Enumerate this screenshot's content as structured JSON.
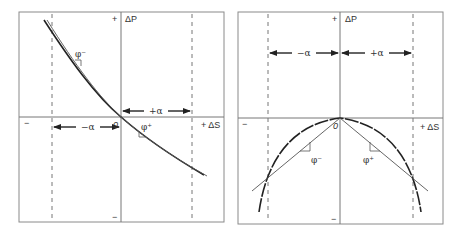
{
  "panels": [
    {
      "id": "left",
      "y_axis_label": "ΔP",
      "y_plus_sign": "+",
      "y_minus_sign": "−",
      "x_axis_label": "+ ΔS",
      "x_minus_sign": "−",
      "origin_label": "0",
      "plus_alpha_label": "+α",
      "minus_alpha_label": "−α",
      "phi_minus_label": "φ⁻",
      "phi_plus_label": "φ⁺",
      "curve_description": "decreasing convex curve through origin with tangent chord"
    },
    {
      "id": "right",
      "y_axis_label": "ΔP",
      "y_plus_sign": "+",
      "y_minus_sign": "−",
      "x_axis_label": "+ ΔS",
      "x_minus_sign": "−",
      "origin_label": "0",
      "plus_alpha_label": "+α",
      "minus_alpha_label": "−α",
      "phi_minus_label": "φ⁻",
      "phi_plus_label": "φ⁺",
      "curve_description": "concave downward parabola peaking at origin with two secant lines"
    }
  ],
  "colors": {
    "frame": "#8a8a8a",
    "axis": "#777777",
    "curve": "#222222",
    "line": "#555555",
    "dash": "#777777"
  }
}
